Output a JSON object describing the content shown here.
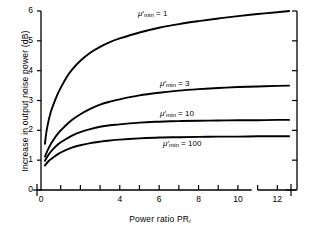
{
  "chart_data": {
    "type": "line",
    "title": "",
    "xlabel": "Power ratio PR",
    "xlabel_sub": "i",
    "ylabel": "Increase in output noise power (dB)",
    "xlim": [
      0,
      13
    ],
    "ylim": [
      0,
      6
    ],
    "xticks_major": [
      0,
      4,
      6,
      8,
      10,
      12
    ],
    "xticks_all": [
      0,
      1,
      2,
      3,
      4,
      5,
      6,
      7,
      8,
      9,
      10,
      11,
      12,
      13
    ],
    "yticks": [
      0,
      1,
      2,
      3,
      4,
      5,
      6
    ],
    "xtick_labels": [
      "0",
      "4",
      "6",
      "8",
      "10",
      "12"
    ],
    "ytick_labels": [
      "0",
      "1",
      "2",
      "3",
      "4",
      "5",
      "6"
    ],
    "grid": false,
    "legend": "inline-curve-labels",
    "axis_break_origin": true,
    "axis_break_right": true,
    "series": [
      {
        "name": "mu'min = 1",
        "label_mu": "μ",
        "label_prime": "′",
        "label_sub": "min",
        "label_eq": " = 1",
        "x": [
          0.2,
          0.3,
          0.5,
          0.8,
          1.0,
          1.3,
          1.6,
          2.0,
          2.5,
          3.0,
          3.5,
          4.0,
          5.0,
          6.0,
          7.0,
          8.0,
          9.0,
          10.0,
          11.0,
          12.0,
          12.6
        ],
        "y": [
          1.55,
          2.05,
          2.62,
          3.15,
          3.42,
          3.78,
          4.05,
          4.33,
          4.6,
          4.8,
          4.96,
          5.08,
          5.28,
          5.44,
          5.56,
          5.66,
          5.75,
          5.83,
          5.9,
          5.96,
          6.0
        ]
      },
      {
        "name": "mu'min = 3",
        "label_mu": "μ",
        "label_prime": "′",
        "label_sub": "min",
        "label_eq": " = 3",
        "x": [
          0.2,
          0.4,
          0.6,
          0.9,
          1.2,
          1.6,
          2.0,
          2.5,
          3.0,
          3.5,
          4.0,
          5.0,
          6.0,
          7.0,
          8.0,
          9.0,
          10.0,
          11.0,
          12.0,
          12.6
        ],
        "y": [
          1.12,
          1.42,
          1.65,
          1.92,
          2.13,
          2.36,
          2.54,
          2.72,
          2.86,
          2.96,
          3.04,
          3.17,
          3.26,
          3.33,
          3.38,
          3.42,
          3.45,
          3.47,
          3.49,
          3.5
        ]
      },
      {
        "name": "mu'min = 10",
        "label_mu": "μ",
        "label_prime": "′",
        "label_sub": "min",
        "label_eq": " = 10",
        "x": [
          0.2,
          0.4,
          0.6,
          0.9,
          1.2,
          1.6,
          2.0,
          2.5,
          3.0,
          3.5,
          4.0,
          5.0,
          6.0,
          7.0,
          8.0,
          9.0,
          10.0,
          11.0,
          12.0,
          12.6
        ],
        "y": [
          0.98,
          1.2,
          1.36,
          1.55,
          1.68,
          1.83,
          1.94,
          2.04,
          2.12,
          2.17,
          2.2,
          2.26,
          2.29,
          2.31,
          2.32,
          2.33,
          2.34,
          2.34,
          2.35,
          2.35
        ]
      },
      {
        "name": "mu'min = 100",
        "label_mu": "μ",
        "label_prime": "′",
        "label_sub": "min",
        "label_eq": " = 100",
        "x": [
          0.2,
          0.4,
          0.6,
          0.9,
          1.2,
          1.6,
          2.0,
          2.5,
          3.0,
          3.5,
          4.0,
          5.0,
          6.0,
          7.0,
          8.0,
          9.0,
          10.0,
          11.0,
          12.0,
          12.6
        ],
        "y": [
          0.82,
          0.98,
          1.08,
          1.22,
          1.32,
          1.43,
          1.5,
          1.57,
          1.62,
          1.66,
          1.69,
          1.73,
          1.76,
          1.77,
          1.78,
          1.79,
          1.79,
          1.8,
          1.8,
          1.8
        ]
      }
    ],
    "curve_labels": [
      {
        "mu": "μ",
        "prime": "′",
        "sub": "min",
        "eq": "= 1",
        "left": 138,
        "top": 9
      },
      {
        "mu": "μ",
        "prime": "′",
        "sub": "min",
        "eq": "= 3",
        "left": 160,
        "top": 79
      },
      {
        "mu": "μ",
        "prime": "′",
        "sub": "min",
        "eq": "= 10",
        "left": 160,
        "top": 109
      },
      {
        "mu": "μ",
        "prime": "′",
        "sub": "min",
        "eq": "= 100",
        "left": 163,
        "top": 139
      }
    ],
    "colors": {
      "curve": "#000000",
      "axis": "#000000",
      "background": "#ffffff"
    }
  }
}
